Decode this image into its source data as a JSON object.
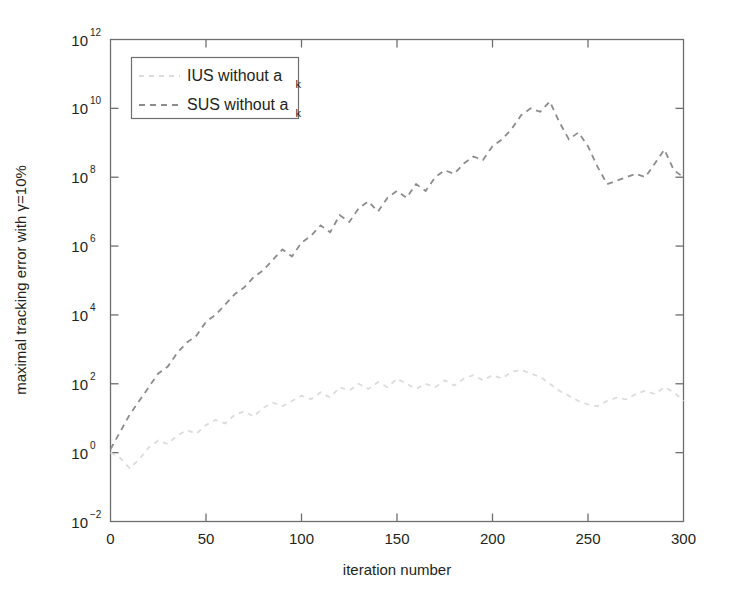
{
  "chart_data": {
    "type": "line",
    "title": "",
    "xlabel": "iteration number",
    "ylabel": "maximal tracking error with γ=10%",
    "xlim": [
      0,
      300
    ],
    "ylim": [
      0.01,
      1000000000000
    ],
    "yscale": "log",
    "grid": false,
    "legend_position": "upper-left",
    "xticks": [
      "0",
      "50",
      "100",
      "150",
      "200",
      "250",
      "300"
    ],
    "xtick_values": [
      0,
      50,
      100,
      150,
      200,
      250,
      300
    ],
    "yticks": [
      "10^-2",
      "10^0",
      "10^2",
      "10^4",
      "10^6",
      "10^8",
      "10^10",
      "10^12"
    ],
    "ytick_exponents": [
      -2,
      0,
      2,
      4,
      6,
      8,
      10,
      12
    ],
    "ytick_base": "10",
    "series": [
      {
        "name": "IUS without a_k",
        "label_main": "IUS without a",
        "label_sub": "k",
        "color": "#dcdcdc",
        "style": "dashdot",
        "x": [
          0,
          5,
          10,
          15,
          20,
          25,
          30,
          35,
          40,
          45,
          50,
          55,
          60,
          65,
          70,
          75,
          80,
          85,
          90,
          95,
          100,
          105,
          110,
          115,
          120,
          125,
          130,
          135,
          140,
          145,
          150,
          155,
          160,
          165,
          170,
          175,
          180,
          185,
          190,
          195,
          200,
          205,
          210,
          215,
          220,
          225,
          230,
          235,
          240,
          245,
          250,
          255,
          260,
          265,
          270,
          275,
          280,
          285,
          290,
          295,
          300
        ],
        "y_exponents": [
          0.0,
          -0.15,
          -0.45,
          -0.2,
          0.15,
          0.35,
          0.25,
          0.5,
          0.65,
          0.55,
          0.8,
          0.95,
          0.85,
          1.1,
          1.2,
          1.05,
          1.3,
          1.45,
          1.35,
          1.5,
          1.65,
          1.55,
          1.75,
          1.6,
          1.9,
          1.8,
          2.0,
          1.85,
          2.05,
          1.9,
          2.15,
          2.0,
          1.85,
          2.0,
          1.9,
          2.1,
          1.95,
          2.15,
          2.25,
          2.1,
          2.25,
          2.15,
          2.35,
          2.4,
          2.3,
          2.2,
          2.0,
          1.8,
          1.65,
          1.5,
          1.4,
          1.35,
          1.5,
          1.6,
          1.55,
          1.7,
          1.8,
          1.7,
          1.9,
          1.75,
          1.5
        ]
      },
      {
        "name": "SUS without a_k",
        "label_main": "SUS without a",
        "label_sub": "k",
        "color": "#8a8c8e",
        "style": "dashed",
        "x": [
          0,
          5,
          10,
          15,
          20,
          25,
          30,
          35,
          40,
          45,
          50,
          55,
          60,
          65,
          70,
          75,
          80,
          85,
          90,
          95,
          100,
          105,
          110,
          115,
          120,
          125,
          130,
          135,
          140,
          145,
          150,
          155,
          160,
          165,
          170,
          175,
          180,
          185,
          190,
          195,
          200,
          205,
          210,
          215,
          220,
          225,
          230,
          235,
          240,
          245,
          250,
          255,
          260,
          265,
          270,
          275,
          280,
          285,
          290,
          295,
          300
        ],
        "y_exponents": [
          0.1,
          0.6,
          1.1,
          1.5,
          1.9,
          2.3,
          2.5,
          2.9,
          3.2,
          3.4,
          3.8,
          4.0,
          4.3,
          4.6,
          4.8,
          5.1,
          5.3,
          5.6,
          5.9,
          5.7,
          6.1,
          6.3,
          6.6,
          6.4,
          6.9,
          6.7,
          7.1,
          7.3,
          7.0,
          7.4,
          7.6,
          7.4,
          7.8,
          7.6,
          8.0,
          8.2,
          8.1,
          8.4,
          8.6,
          8.5,
          8.9,
          9.1,
          9.4,
          9.8,
          10.0,
          9.9,
          10.2,
          9.6,
          9.1,
          9.3,
          8.9,
          8.3,
          7.8,
          7.9,
          8.0,
          8.1,
          8.0,
          8.4,
          8.8,
          8.2,
          8.0
        ]
      }
    ]
  },
  "axes": {
    "x_label": "iteration number",
    "y_label_text": "maximal tracking error with γ=10%"
  },
  "legend": {
    "entries": [
      {
        "main": "IUS without a",
        "sub": "k"
      },
      {
        "main": "SUS without a",
        "sub": "k"
      }
    ]
  },
  "colors": {
    "series_ius": "#dcdcdc",
    "series_sus": "#8a8c8e",
    "axis": "#6d6e70",
    "text": "#231f20",
    "background": "#ffffff"
  }
}
